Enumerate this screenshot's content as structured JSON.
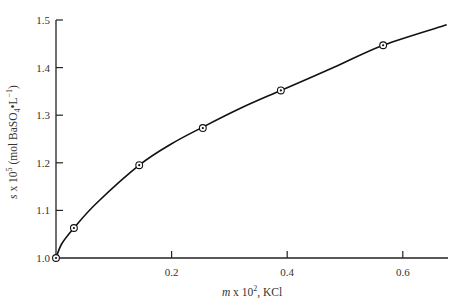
{
  "chart_data": {
    "type": "scatter",
    "title": "",
    "xlabel": "m x 10², KCl",
    "xlabel_parts": {
      "var": "m",
      "rest": " x 10",
      "sup": "2",
      "tail": ", KCl"
    },
    "ylabel": "s x 10⁵ (mol BaSO₄•L⁻¹)",
    "ylabel_parts": {
      "var": "s",
      "a": " x 10",
      "sup1": "5",
      "b": " (mol BaSO",
      "sub": "4",
      "c": "•L",
      "sup2": "−1",
      "d": ")"
    },
    "xlim": [
      0,
      0.68
    ],
    "ylim": [
      1.0,
      1.5
    ],
    "xticks": [
      0.2,
      0.4,
      0.6
    ],
    "xtick_labels": [
      "0.2",
      "0.4",
      "0.6"
    ],
    "yticks": [
      1.0,
      1.1,
      1.2,
      1.3,
      1.4,
      1.5
    ],
    "ytick_labels": [
      "1.0",
      "1.1",
      "1.2",
      "1.3",
      "1.4",
      "1.5"
    ],
    "grid": false,
    "legend": null,
    "series": [
      {
        "name": "measured solubility",
        "marker": "circled-dot",
        "x": [
          0.0,
          0.031,
          0.144,
          0.254,
          0.389,
          0.566
        ],
        "y": [
          1.0,
          1.063,
          1.195,
          1.273,
          1.352,
          1.447
        ]
      },
      {
        "name": "fitted curve",
        "style": "line",
        "x": [
          0.0,
          0.01,
          0.031,
          0.07,
          0.144,
          0.2,
          0.254,
          0.32,
          0.389,
          0.48,
          0.566,
          0.676
        ],
        "y": [
          1.0,
          1.03,
          1.063,
          1.115,
          1.195,
          1.24,
          1.275,
          1.315,
          1.352,
          1.4,
          1.447,
          1.49
        ]
      }
    ],
    "colors": {
      "axis": "#222222",
      "line": "#111111",
      "text": "#333333"
    }
  }
}
